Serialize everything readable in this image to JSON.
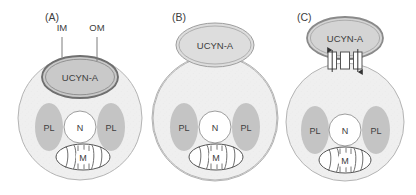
{
  "figure": {
    "background": "#ffffff"
  },
  "colors": {
    "cell_fill": "#efefef",
    "cell_stroke": "#b4b4b4",
    "symbiont_fill_dark": "#c9c9c9",
    "symbiont_fill_light": "#dddddd",
    "symbiont_stroke_dark": "#777777",
    "symbiont_stroke_light": "#9d9d9d",
    "plastid_fill": "#c4c4c4",
    "plastid_stroke": "#c4c4c4",
    "nucleus_fill": "#ffffff",
    "nucleus_stroke": "#9d9d9d",
    "mito_fill": "#ffffff",
    "mito_stroke": "#555555",
    "transporter_fill": "#ffffff",
    "transporter_stroke": "#555555",
    "arrow_color": "#333333",
    "text": "#3d3d3d"
  },
  "panels": [
    {
      "id": "A",
      "letter": "(A)",
      "symbiont_label": "UCYN-A",
      "symbiont_position": "internal",
      "callouts": [
        {
          "label": "IM",
          "target": "inner-membrane"
        },
        {
          "label": "OM",
          "target": "outer-membrane"
        }
      ],
      "organelles": [
        {
          "label": "PL",
          "name": "plastid-left"
        },
        {
          "label": "N",
          "name": "nucleus"
        },
        {
          "label": "PL",
          "name": "plastid-right"
        },
        {
          "label": "M",
          "name": "mitochondrion"
        }
      ]
    },
    {
      "id": "B",
      "letter": "(B)",
      "symbiont_label": "UCYN-A",
      "symbiont_position": "external-attached",
      "callouts": [],
      "organelles": [
        {
          "label": "PL",
          "name": "plastid-left"
        },
        {
          "label": "N",
          "name": "nucleus"
        },
        {
          "label": "PL",
          "name": "plastid-right"
        },
        {
          "label": "M",
          "name": "mitochondrion"
        }
      ]
    },
    {
      "id": "C",
      "letter": "(C)",
      "symbiont_label": "UCYN-A",
      "symbiont_position": "external-transporters",
      "callouts": [],
      "transporters": {
        "count": 3,
        "arrows": 2
      },
      "organelles": [
        {
          "label": "PL",
          "name": "plastid-left"
        },
        {
          "label": "N",
          "name": "nucleus"
        },
        {
          "label": "PL",
          "name": "plastid-right"
        },
        {
          "label": "M",
          "name": "mitochondrion"
        }
      ]
    }
  ]
}
